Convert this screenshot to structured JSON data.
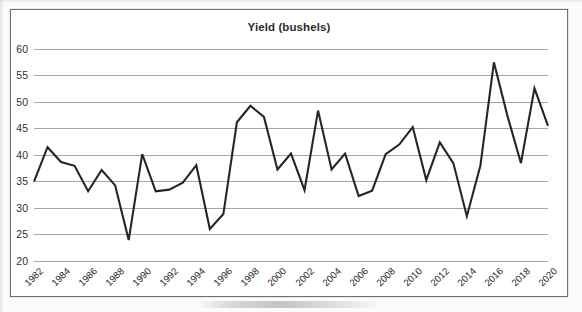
{
  "chart_data": {
    "type": "line",
    "title": "Yield (bushels)",
    "xlabel": "",
    "ylabel": "",
    "ylim": [
      20,
      60
    ],
    "yticks": [
      20,
      25,
      30,
      35,
      40,
      45,
      50,
      55,
      60
    ],
    "ytick_labels": [
      "20",
      "25",
      "30",
      "35",
      "40",
      "45",
      "50",
      "55",
      "60"
    ],
    "grid": true,
    "legend": "none",
    "line_color": "#262626",
    "x_tick_rotation": -45,
    "x_tick_step": 2,
    "x": [
      1982,
      1983,
      1984,
      1985,
      1986,
      1987,
      1988,
      1989,
      1990,
      1991,
      1992,
      1993,
      1994,
      1995,
      1996,
      1997,
      1998,
      1999,
      2000,
      2001,
      2002,
      2003,
      2004,
      2005,
      2006,
      2007,
      2008,
      2009,
      2010,
      2011,
      2012,
      2013,
      2014,
      2015,
      2016,
      2017,
      2018,
      2019,
      2020
    ],
    "xtick_labels": [
      "1982",
      "1984",
      "1986",
      "1988",
      "1990",
      "1992",
      "1994",
      "1996",
      "1998",
      "2000",
      "2002",
      "2004",
      "2006",
      "2008",
      "2010",
      "2012",
      "2014",
      "2016",
      "2018",
      "2020"
    ],
    "values": [
      35.0,
      41.5,
      38.7,
      38.0,
      33.2,
      37.2,
      34.3,
      24.0,
      40.2,
      33.2,
      33.5,
      34.8,
      38.1,
      26.1,
      28.9,
      46.2,
      49.3,
      47.2,
      37.3,
      40.3,
      33.4,
      48.4,
      37.3,
      40.3,
      32.3,
      33.3,
      40.2,
      42.0,
      45.3,
      35.3,
      42.4,
      38.5,
      28.5,
      38.0,
      57.5,
      47.4,
      38.5,
      52.6,
      45.5
    ],
    "series": [
      {
        "name": "Yield (bushels)",
        "values": [
          35.0,
          41.5,
          38.7,
          38.0,
          33.2,
          37.2,
          34.3,
          24.0,
          40.2,
          33.2,
          33.5,
          34.8,
          38.1,
          26.1,
          28.9,
          46.2,
          49.3,
          47.2,
          37.3,
          40.3,
          33.4,
          48.4,
          37.3,
          40.3,
          32.3,
          33.3,
          40.2,
          42.0,
          45.3,
          35.3,
          42.4,
          38.5,
          28.5,
          38.0,
          57.5,
          47.4,
          38.5,
          52.6,
          45.5
        ]
      }
    ]
  }
}
